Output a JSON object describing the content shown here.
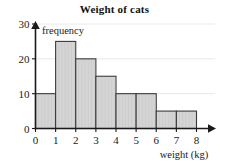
{
  "chart_data": {
    "type": "bar",
    "title": "Weight of cats",
    "xlabel": "weight (kg)",
    "ylabel": "frequency",
    "categories": [
      "0-1",
      "1-2",
      "2-3",
      "3-4",
      "4-5",
      "5-6",
      "6-7",
      "7-8"
    ],
    "bin_edges": [
      0,
      1,
      2,
      3,
      4,
      5,
      6,
      7,
      8
    ],
    "values": [
      10,
      25,
      20,
      15,
      10,
      10,
      5,
      5
    ],
    "xlim": [
      0,
      8
    ],
    "ylim": [
      0,
      30
    ],
    "x_ticks": [
      "0",
      "1",
      "2",
      "3",
      "4",
      "5",
      "6",
      "7",
      "8"
    ],
    "y_ticks": [
      "0",
      "10",
      "20",
      "30"
    ],
    "y_tick_values": [
      0,
      10,
      20,
      30
    ],
    "grid": true,
    "legend": "none",
    "bar_fill_color": "#d5d5d5",
    "bar_stroke_color": "#3a3a3a",
    "axis_color": "#1a1a1a",
    "gridline_color": "#e9e9e9"
  }
}
